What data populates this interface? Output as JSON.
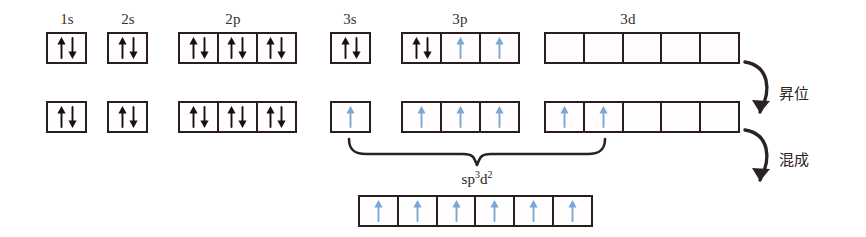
{
  "diagram": {
    "colors": {
      "box_border": "#2a1d1f",
      "paired_arrow": "#151011",
      "unpaired_arrow": "#7ba7d7",
      "text": "#39302f",
      "background": "#ffffff"
    },
    "orbital_labels": [
      {
        "text": "1s",
        "x": 67,
        "y": 12
      },
      {
        "text": "2s",
        "x": 128,
        "y": 12
      },
      {
        "text": "2p",
        "x": 233,
        "y": 12
      },
      {
        "text": "3s",
        "x": 350,
        "y": 12
      },
      {
        "text": "3p",
        "x": 460,
        "y": 12
      },
      {
        "text": "3d",
        "x": 628,
        "y": 12
      }
    ],
    "rows": [
      {
        "name": "ground-state",
        "y": 32,
        "groups": [
          {
            "name": "1s",
            "x": 46,
            "cells": [
              "pair"
            ]
          },
          {
            "name": "2s",
            "x": 107,
            "cells": [
              "pair"
            ]
          },
          {
            "name": "2p",
            "x": 178,
            "cells": [
              "pair",
              "pair",
              "pair"
            ]
          },
          {
            "name": "3s",
            "x": 330,
            "cells": [
              "pair"
            ]
          },
          {
            "name": "3p",
            "x": 401,
            "cells": [
              "pair",
              "up",
              "up"
            ]
          },
          {
            "name": "3d",
            "x": 544,
            "cells": [
              "empty",
              "empty",
              "empty",
              "empty",
              "empty"
            ]
          }
        ]
      },
      {
        "name": "promoted-state",
        "y": 101,
        "groups": [
          {
            "name": "1s",
            "x": 46,
            "cells": [
              "pair"
            ]
          },
          {
            "name": "2s",
            "x": 107,
            "cells": [
              "pair"
            ]
          },
          {
            "name": "2p",
            "x": 178,
            "cells": [
              "pair",
              "pair",
              "pair"
            ]
          },
          {
            "name": "3s",
            "x": 330,
            "cells": [
              "up"
            ]
          },
          {
            "name": "3p",
            "x": 401,
            "cells": [
              "up",
              "up",
              "up"
            ]
          },
          {
            "name": "3d",
            "x": 544,
            "cells": [
              "up",
              "up",
              "empty",
              "empty",
              "empty"
            ]
          }
        ]
      },
      {
        "name": "hybrid-state",
        "y": 195,
        "groups": [
          {
            "name": "sp3d2",
            "x": 358,
            "cells": [
              "up",
              "up",
              "up",
              "up",
              "up",
              "up"
            ]
          }
        ]
      }
    ],
    "cell_size": {
      "w": 41,
      "h": 32
    },
    "steps": [
      {
        "name": "promotion",
        "label": "昇位",
        "x": 779,
        "y": 86
      },
      {
        "name": "hybridization",
        "label": "混成",
        "x": 779,
        "y": 152
      }
    ],
    "hybrid_orbital": {
      "name": "sp3d2-label",
      "base": "sp",
      "sup1": "3",
      "mid": "d",
      "sup2": "2",
      "x": 477,
      "y": 170
    },
    "brace": {
      "name": "sp3d2-brace",
      "left_x": 348,
      "right_x": 606,
      "y": 143,
      "tip_x": 477
    }
  }
}
